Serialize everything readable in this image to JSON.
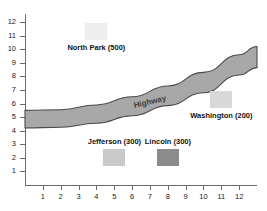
{
  "chart_data": {
    "type": "scatter",
    "title": "",
    "xlabel": "",
    "ylabel": "",
    "xlim": [
      0,
      13
    ],
    "ylim": [
      0,
      12.6
    ],
    "grid": false,
    "legend": "none",
    "x_ticks": [
      "1",
      "2",
      "3",
      "4",
      "5",
      "6",
      "7",
      "8",
      "9",
      "10",
      "11",
      "12"
    ],
    "y_ticks": [
      "12",
      "11",
      "10",
      "9",
      "8",
      "7",
      "6",
      "5",
      "4",
      "3",
      "2",
      "1"
    ],
    "points": [
      {
        "name": "North Park",
        "label": "North Park (500)",
        "value": 500,
        "x": 4.0,
        "y": 11.3,
        "color": "#eeeeee",
        "label_position": "below"
      },
      {
        "name": "Washington",
        "label": "Washington (200)",
        "value": 200,
        "x": 11.0,
        "y": 6.3,
        "color": "#d8d8d8",
        "label_position": "below"
      },
      {
        "name": "Jefferson",
        "label": "Jefferson (300)",
        "value": 300,
        "x": 5.0,
        "y": 2.0,
        "color": "#c9c9c9",
        "label_position": "above"
      },
      {
        "name": "Lincoln",
        "label": "Lincoln (300)",
        "value": 300,
        "x": 8.0,
        "y": 2.0,
        "color": "#8c8c8c",
        "label_position": "above"
      }
    ],
    "band": {
      "name": "Highway",
      "label": "Highway",
      "fill_color": "#a8a8a8",
      "edge_color": "#4a4a4a",
      "x": [
        0.0,
        2.0,
        4.0,
        6.0,
        8.0,
        10.0,
        12.0,
        13.0
      ],
      "upper": [
        5.5,
        5.55,
        5.9,
        6.5,
        7.3,
        8.3,
        9.6,
        10.2
      ],
      "lower": [
        4.2,
        4.25,
        4.55,
        5.1,
        5.85,
        6.8,
        8.1,
        8.65
      ]
    }
  }
}
